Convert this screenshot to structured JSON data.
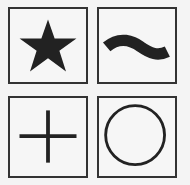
{
  "grid": {
    "tiles": [
      {
        "symbol": "star",
        "icon": "star-icon"
      },
      {
        "symbol": "tilde",
        "icon": "tilde-icon"
      },
      {
        "symbol": "plus",
        "icon": "plus-icon"
      },
      {
        "symbol": "circle",
        "icon": "circle-icon"
      }
    ]
  },
  "colors": {
    "ink": "#222222",
    "border": "#333333",
    "background": "#f6f6f6"
  }
}
